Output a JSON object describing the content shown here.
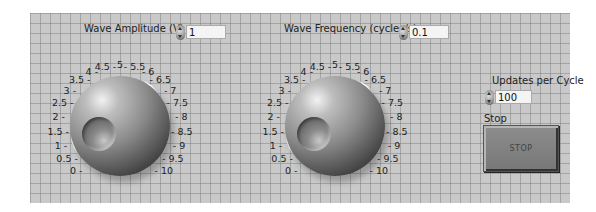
{
  "controls": {
    "amplitude": {
      "label": "Wave Amplitude (V)",
      "value": "1",
      "scale": [
        "0",
        "0.5",
        "1",
        "1.5",
        "2",
        "2.5",
        "3",
        "3.5",
        "4",
        "4.5",
        "5",
        "5.5",
        "6",
        "6.5",
        "7",
        "7.5",
        "8",
        "8.5",
        "9",
        "9.5",
        "10"
      ]
    },
    "frequency": {
      "label": "Wave Frequency (cycles/s)",
      "value": "0.1",
      "scale": [
        "0",
        "0.5",
        "1",
        "1.5",
        "2",
        "2.5",
        "3",
        "3.5",
        "4",
        "4.5",
        "5",
        "5.5",
        "6",
        "6.5",
        "7",
        "7.5",
        "8",
        "8.5",
        "9",
        "9.5",
        "10"
      ]
    },
    "updates": {
      "label": "Updates per Cycle",
      "value": "100"
    },
    "stop": {
      "label": "Stop",
      "button_text": "STOP"
    }
  },
  "colors": {
    "panel_bg": "#c9c9c9",
    "grid_line": "#787878"
  }
}
